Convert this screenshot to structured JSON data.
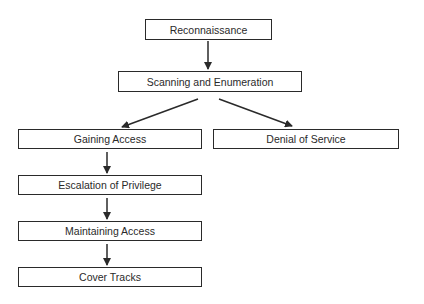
{
  "diagram": {
    "title": "",
    "nodes": [
      {
        "id": "recon",
        "label": "Reconnaissance"
      },
      {
        "id": "scan",
        "label": "Scanning and Enumeration"
      },
      {
        "id": "gain",
        "label": "Gaining Access"
      },
      {
        "id": "dos",
        "label": "Denial of Service"
      },
      {
        "id": "escalate",
        "label": "Escalation of Privilege"
      },
      {
        "id": "maintain",
        "label": "Maintaining Access"
      },
      {
        "id": "cover",
        "label": "Cover Tracks"
      }
    ],
    "edges": [
      {
        "from": "recon",
        "to": "scan"
      },
      {
        "from": "scan",
        "to": "gain"
      },
      {
        "from": "scan",
        "to": "dos"
      },
      {
        "from": "gain",
        "to": "escalate"
      },
      {
        "from": "escalate",
        "to": "maintain"
      },
      {
        "from": "maintain",
        "to": "cover"
      }
    ],
    "colors": {
      "stroke": "#2a2a2a",
      "background": "#ffffff"
    }
  }
}
